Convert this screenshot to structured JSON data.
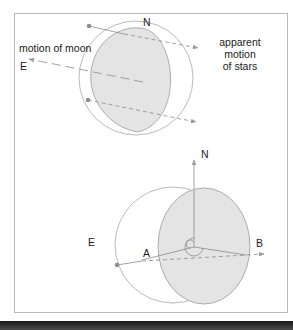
{
  "diagram": {
    "top_figure": {
      "label_north": "N",
      "label_east": "E",
      "label_motion_moon": "motion of moon",
      "label_apparent_motion": [
        "apparent",
        "motion",
        "of stars"
      ]
    },
    "bottom_figure": {
      "label_north": "N",
      "label_east": "E",
      "label_a": "A",
      "label_b": "B"
    },
    "colors": {
      "shaded_disk": "#e3e3e3",
      "outline": "#9a9a9a",
      "dashed": "#888888",
      "arrow": "#8c8c8c",
      "text": "#1a1a1a"
    }
  }
}
